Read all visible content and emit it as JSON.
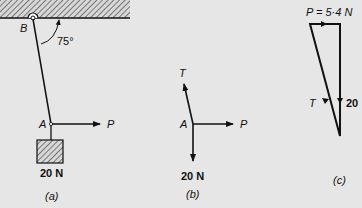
{
  "figure": {
    "panel_a": {
      "caption": "(a)",
      "pin_label": "B",
      "joint_label": "A",
      "angle_label": "75°",
      "force_label": "P",
      "weight_label": "20 N"
    },
    "panel_b": {
      "caption": "(b)",
      "joint_label": "A",
      "tension_label": "T",
      "force_label": "P",
      "weight_label": "20 N"
    },
    "panel_c": {
      "caption": "(c)",
      "top_label": "P = 5·4 N",
      "tension_label": "T",
      "weight_label": "20"
    }
  }
}
